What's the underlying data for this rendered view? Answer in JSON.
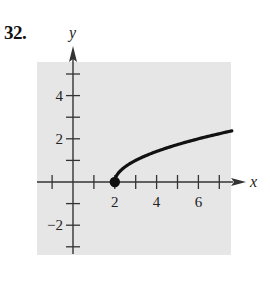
{
  "problem": {
    "number": "32."
  },
  "chart_data": {
    "type": "line",
    "title": "",
    "xlabel": "x",
    "ylabel": "y",
    "xlim": [
      -1.7,
      7.6
    ],
    "ylim": [
      -3.4,
      5.6
    ],
    "grid": false,
    "legend": null,
    "x_ticks": [
      -1,
      1,
      2,
      3,
      4,
      5,
      6,
      7
    ],
    "x_tick_labels": [
      {
        "value": 2,
        "label": "2"
      },
      {
        "value": 4,
        "label": "4"
      },
      {
        "value": 6,
        "label": "6"
      }
    ],
    "y_ticks": [
      -3,
      -2,
      -1,
      1,
      2,
      3,
      4,
      5
    ],
    "y_tick_labels": [
      {
        "value": 4,
        "label": "4"
      },
      {
        "value": 2,
        "label": "2"
      },
      {
        "value": -2,
        "label": "−2"
      }
    ],
    "series": [
      {
        "name": "y = sqrt(x - 2)",
        "x": [
          2,
          2.25,
          2.5,
          3,
          3.5,
          4,
          4.5,
          5,
          5.5,
          6,
          6.5,
          7,
          7.6
        ],
        "y": [
          0,
          0.5,
          0.71,
          1.0,
          1.22,
          1.41,
          1.58,
          1.73,
          1.87,
          2.0,
          2.12,
          2.24,
          2.37
        ],
        "start_point": {
          "x": 2,
          "y": 0,
          "marker": "filled-circle"
        }
      }
    ],
    "background_color": "#e6e6e6",
    "line_color": "#111111"
  }
}
